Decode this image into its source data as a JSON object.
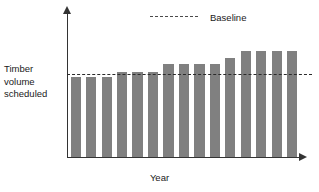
{
  "chart_data": {
    "type": "bar",
    "title": "",
    "xlabel": "Year",
    "ylabel": "Timber volume scheduled",
    "ylabel_lines": [
      "Timber",
      "volume",
      "scheduled"
    ],
    "categories": [
      "1",
      "2",
      "3",
      "4",
      "5",
      "6",
      "7",
      "8",
      "9",
      "10",
      "11",
      "12",
      "13",
      "14",
      "15"
    ],
    "values": [
      96,
      96,
      96,
      103,
      103,
      103,
      112,
      112,
      112,
      112,
      119,
      128,
      128,
      128,
      128
    ],
    "series": [
      {
        "name": "Timber volume scheduled",
        "color": "#808080",
        "values": [
          96,
          96,
          96,
          103,
          103,
          103,
          112,
          112,
          112,
          112,
          119,
          128,
          128,
          128,
          128
        ]
      }
    ],
    "reference_lines": [
      {
        "name": "Baseline",
        "value": 100,
        "style": "dashed",
        "color": "#2b2b2b"
      }
    ],
    "ylim": [
      0,
      175
    ],
    "grid": false,
    "axis_ticks": false,
    "legend_position": "top-center",
    "annotations": []
  },
  "legend": {
    "entries": [
      {
        "label": "Baseline",
        "style": "dashed",
        "color": "#2b2b2b"
      }
    ]
  },
  "axes": {
    "y_title_line1": "Timber",
    "y_title_line2": "volume",
    "y_title_line3": "scheduled",
    "x_title": "Year"
  },
  "colors": {
    "bar": "#808080",
    "axis": "#333333",
    "baseline": "#2b2b2b",
    "text": "#1a1a1a",
    "background": "#ffffff"
  }
}
